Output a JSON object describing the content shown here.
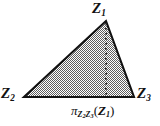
{
  "figure": {
    "background_color": "#ffffff",
    "outline_color": "#111111",
    "fill_color": "#9b9b9b",
    "dotted_line_color": "#2a2a2a",
    "vertices": {
      "apex": {
        "label_var": "Z",
        "label_sub": "1",
        "x": 106,
        "y": 20
      },
      "bottom_left": {
        "label_var": "Z",
        "label_sub": "2",
        "x": 24,
        "y": 97
      },
      "bottom_right": {
        "label_var": "Z",
        "label_sub": "3",
        "x": 134,
        "y": 97
      }
    },
    "labels": {
      "apex": {
        "var": "Z",
        "sub": "1"
      },
      "bottom_left": {
        "var": "Z",
        "sub": "2"
      },
      "bottom_right": {
        "var": "Z",
        "sub": "3"
      },
      "projection": {
        "operator": "π",
        "sub_var_1": "Z",
        "sub_sub_1": "2",
        "sub_var_2": "Z",
        "sub_sub_2": "3",
        "open_paren": "(",
        "arg_var": "Z",
        "arg_sub": "1",
        "close_paren": ")"
      }
    },
    "dotted_line": {
      "name": "altitude-projection-line",
      "from_x": 106,
      "from_y": 22,
      "to_x": 106,
      "to_y": 97
    }
  }
}
